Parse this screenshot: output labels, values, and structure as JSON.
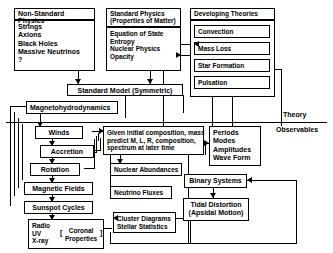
{
  "diagram": {
    "title_regions": {
      "theory_label": "Theory",
      "observables_label": "Observables"
    },
    "nonstandard": {
      "header": "Non-Standard Physics",
      "items": [
        "Strings",
        "Axions",
        "Black Holes",
        "Massive Neutrinos",
        "?"
      ]
    },
    "standard": {
      "header_line1": "Standard Physics",
      "header_line2": "(Properties of Matter)",
      "items": [
        "Equation of State",
        "Entropy",
        "Nuclear Physics",
        "Opacity"
      ]
    },
    "developing": {
      "header": "Developing Theories",
      "items": [
        "Convection",
        "Mass Loss",
        "Star Formation",
        "Pulsation"
      ]
    },
    "standard_model": "Standard Model (Symmetric)",
    "mhd": "Magnetohydrodynamics",
    "left_chain": [
      "Winds",
      "Accretion",
      "Rotation",
      "Magnetic Fields",
      "Sunspot Cycles"
    ],
    "emission": {
      "items": [
        "Radio",
        "UV",
        "X-ray"
      ],
      "coronal_line1": "Coronal",
      "coronal_line2": "Properties",
      "bracket_left": "[",
      "bracket_right": "]"
    },
    "model": {
      "line1": "Given initial composition, mass",
      "line2": "predict M, L, R, composition,",
      "line3": "spectrum at later time"
    },
    "nuclear_abundances": "Nuclear Abundances",
    "neutrino_fluxes": "Neutrino Fluxes",
    "cluster": {
      "line1": "Cluster Diagrams",
      "line2": "Stellar Statistics"
    },
    "pulsation_obs": [
      "Periods",
      "Modes",
      "Amplitudes",
      "Wave Form"
    ],
    "binary_systems": "Binary Systems",
    "tidal": {
      "line1": "Tidal Distortion",
      "line2": "(Apsidal Motion)"
    },
    "colors": {
      "line": "#000000",
      "background": "#ffffff",
      "text": "#000000"
    }
  }
}
